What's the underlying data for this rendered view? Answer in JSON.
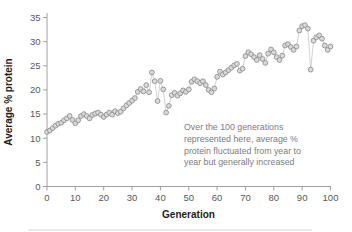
{
  "chart_data": {
    "type": "line",
    "title": "",
    "xlabel": "Generation",
    "ylabel": "Average % protein",
    "x_ticks": [
      0,
      10,
      20,
      30,
      40,
      50,
      60,
      70,
      80,
      90,
      100
    ],
    "y_ticks": [
      0,
      5,
      10,
      15,
      20,
      25,
      30,
      35
    ],
    "xlim": [
      0,
      100
    ],
    "ylim": [
      0,
      35
    ],
    "grid": false,
    "legend_position": "none",
    "marker": "circle",
    "series": [
      {
        "name": "average-percent-protein",
        "x_start": 0,
        "x_step": 1,
        "values": [
          11.3,
          11.6,
          12.1,
          12.6,
          13.0,
          13.2,
          13.7,
          14.1,
          14.6,
          13.8,
          13.1,
          13.7,
          14.6,
          15.0,
          14.6,
          14.1,
          14.8,
          15.1,
          15.3,
          14.9,
          14.4,
          14.9,
          15.3,
          14.9,
          15.6,
          15.2,
          15.5,
          16.2,
          16.8,
          17.3,
          17.8,
          18.3,
          19.6,
          20.2,
          19.7,
          21.0,
          19.5,
          23.6,
          21.8,
          17.7,
          21.9,
          20.1,
          15.3,
          16.7,
          18.9,
          19.4,
          18.8,
          19.3,
          19.9,
          19.6,
          20.1,
          21.7,
          22.2,
          21.8,
          21.4,
          21.8,
          21.0,
          20.0,
          19.5,
          20.3,
          22.7,
          23.8,
          23.2,
          23.6,
          24.1,
          24.6,
          25.1,
          25.4,
          24.0,
          24.4,
          27.0,
          27.8,
          27.4,
          26.8,
          26.2,
          27.2,
          26.4,
          25.6,
          27.5,
          28.4,
          27.8,
          26.8,
          26.2,
          27.1,
          29.2,
          29.5,
          28.9,
          28.3,
          29.0,
          32.3,
          33.2,
          33.4,
          32.7,
          24.2,
          30.2,
          30.9,
          31.3,
          30.6,
          29.2,
          28.3,
          29.0
        ]
      }
    ],
    "annotation": {
      "lines": [
        "Over the 100 generations",
        "represented here, average %",
        "protein fluctuated from year to",
        "year but generally increased"
      ]
    }
  },
  "style": {
    "marker_fill": "#d9d9d9",
    "marker_stroke": "#909090",
    "line_color": "#c7c7c7",
    "axis_color": "#a0a0a0",
    "tick_label_color": "#58595b",
    "axis_title_color": "#1c1c1c",
    "annotation_color": "#7a7b7e",
    "background": "#ffffff"
  }
}
